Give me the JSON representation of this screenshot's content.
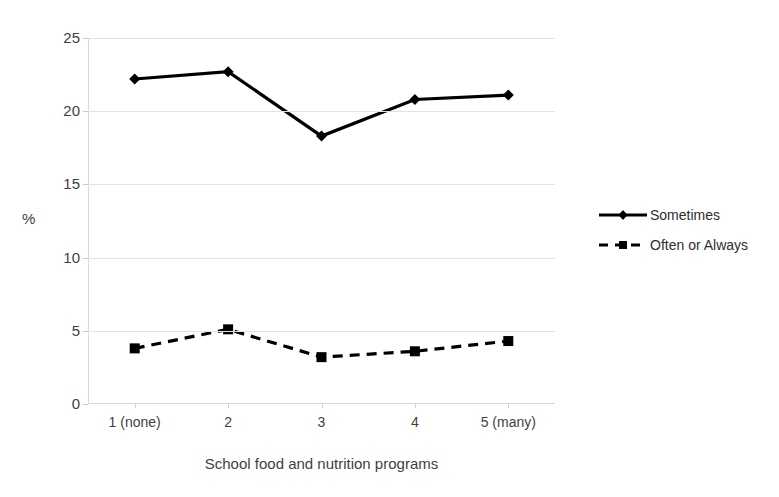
{
  "chart_data": {
    "type": "line",
    "title": "",
    "xlabel": "School food and nutrition programs",
    "ylabel": "%",
    "categories": [
      "1 (none)",
      "2",
      "3",
      "4",
      "5 (many)"
    ],
    "ylim": [
      0,
      25
    ],
    "yticks": [
      0,
      5,
      10,
      15,
      20,
      25
    ],
    "ytick_labels": [
      "0",
      "5",
      "10",
      "15",
      "20",
      "25"
    ],
    "grid": "horizontal",
    "legend_position": "right",
    "series": [
      {
        "name": "Sometimes",
        "marker": "diamond",
        "linestyle": "solid",
        "color": "#000000",
        "values": [
          22.2,
          22.7,
          18.3,
          20.8,
          21.1
        ]
      },
      {
        "name": "Often or Always",
        "marker": "square",
        "linestyle": "dashed",
        "color": "#000000",
        "values": [
          3.8,
          5.1,
          3.2,
          3.6,
          4.3
        ]
      }
    ]
  },
  "axes": {
    "y_title": "%",
    "x_title": "School food and nutrition programs"
  },
  "legend": {
    "items": [
      {
        "label": "Sometimes"
      },
      {
        "label": "Often or Always"
      }
    ]
  }
}
